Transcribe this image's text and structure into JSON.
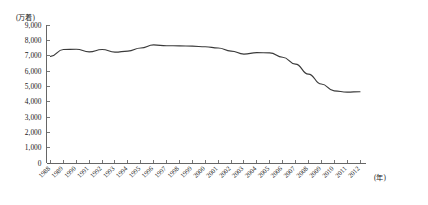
{
  "chart_data": {
    "type": "line",
    "title": "",
    "xlabel": "(年)",
    "ylabel": "(万着)",
    "ylim": [
      0,
      9000
    ],
    "ytick_values": [
      0,
      1000,
      2000,
      3000,
      4000,
      5000,
      6000,
      7000,
      8000,
      9000
    ],
    "ytick_labels": [
      "0",
      "1,000",
      "2,000",
      "3,000",
      "4,000",
      "5,000",
      "6,000",
      "7,000",
      "8,000",
      "9,000"
    ],
    "grid": false,
    "legend": null,
    "categories": [
      "1988",
      "1989",
      "1990",
      "1991",
      "1992",
      "1993",
      "1994",
      "1995",
      "1996",
      "1997",
      "1998",
      "1999",
      "2000",
      "2001",
      "2002",
      "2003",
      "2004",
      "2005",
      "2006",
      "2007",
      "2008",
      "2009",
      "2010",
      "2011",
      "2012"
    ],
    "values": [
      6950,
      7400,
      7420,
      7250,
      7400,
      7230,
      7300,
      7500,
      7700,
      7650,
      7640,
      7620,
      7580,
      7500,
      7300,
      7100,
      7200,
      7180,
      6900,
      6450,
      5800,
      5150,
      4700,
      4620,
      4650
    ],
    "series": [
      {
        "name": "",
        "values": [
          6950,
          7400,
          7420,
          7250,
          7400,
          7230,
          7300,
          7500,
          7700,
          7650,
          7640,
          7620,
          7580,
          7500,
          7300,
          7100,
          7200,
          7180,
          6900,
          6450,
          5800,
          5150,
          4700,
          4620,
          4650
        ]
      }
    ]
  },
  "axes": {
    "y_unit_label": "(万着)",
    "x_unit_label": "(年)"
  }
}
